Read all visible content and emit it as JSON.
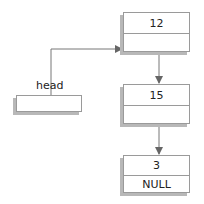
{
  "diagram": {
    "type": "linked-list",
    "head": {
      "label": "head"
    },
    "nodes": [
      {
        "value": "12",
        "next": ""
      },
      {
        "value": "15",
        "next": ""
      },
      {
        "value": "3",
        "next": "NULL"
      }
    ]
  },
  "colors": {
    "line": "#777777",
    "border": "#9a9a9a",
    "shadow": "#b8b8b8"
  }
}
